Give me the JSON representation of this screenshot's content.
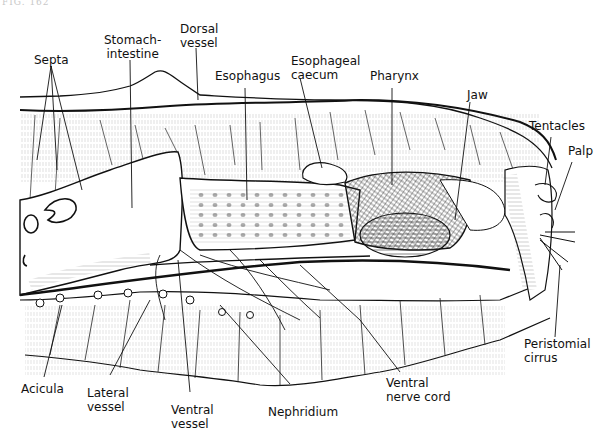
{
  "figure": {
    "number_label": "FIG. 162",
    "ink_color": "#111111",
    "background_color": "#ffffff"
  },
  "labels": {
    "septa": "Septa",
    "stomach_intestine_1": "Stomach-",
    "stomach_intestine_2": "intestine",
    "dorsal_vessel_1": "Dorsal",
    "dorsal_vessel_2": "vessel",
    "esophagus": "Esophagus",
    "esophageal_caecum_1": "Esophageal",
    "esophageal_caecum_2": "caecum",
    "pharynx": "Pharynx",
    "jaw": "Jaw",
    "tentacles": "Tentacles",
    "palp": "Palp",
    "peristomial_cirrus_1": "Peristomial",
    "peristomial_cirrus_2": "cirrus",
    "acicula": "Acicula",
    "lateral_vessel_1": "Lateral",
    "lateral_vessel_2": "vessel",
    "ventral_vessel_1": "Ventral",
    "ventral_vessel_2": "vessel",
    "nephridium": "Nephridium",
    "ventral_nerve_cord_1": "Ventral",
    "ventral_nerve_cord_2": "nerve cord"
  }
}
